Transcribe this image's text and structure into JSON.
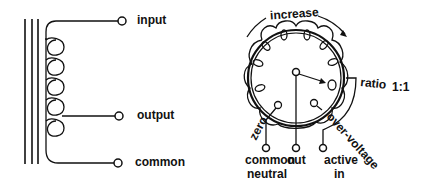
{
  "left_diagram": {
    "type": "autotransformer schematic",
    "labels": {
      "input": "input",
      "output": "output",
      "common": "common"
    }
  },
  "right_diagram": {
    "type": "variable autotransformer (variac) dial",
    "labels": {
      "increase": "increase",
      "ratio": "ratio",
      "ratio_value": "1:1",
      "zero": "zero",
      "over_voltage": "over-voltage",
      "common": "common",
      "neutral": "neutral",
      "out": "out",
      "active": "active",
      "in": "in"
    }
  },
  "colors": {
    "ink": "#111111",
    "background": "#ffffff"
  }
}
